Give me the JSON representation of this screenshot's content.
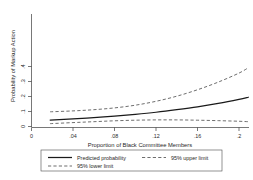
{
  "chart_data": {
    "type": "line",
    "title": "",
    "xlabel": "Proportion of Black Committee Members",
    "ylabel": "Probability of Markup Action",
    "xlim": [
      0,
      0.215
    ],
    "ylim": [
      0,
      0.45
    ],
    "xticks": [
      0,
      0.04,
      0.08,
      0.12,
      0.16,
      0.2
    ],
    "xticklabels": [
      "0",
      ".04",
      ".08",
      ".12",
      ".16",
      ".2"
    ],
    "yticks": [
      0,
      0.1,
      0.2,
      0.3,
      0.4
    ],
    "yticklabels": [
      "0",
      ".1",
      ".2",
      ".3",
      ".4"
    ],
    "grid": false,
    "legend_position": "below-axes",
    "x": [
      0.018,
      0.04,
      0.06,
      0.08,
      0.1,
      0.12,
      0.14,
      0.16,
      0.18,
      0.2,
      0.209
    ],
    "series": [
      {
        "name": "Predicted probability",
        "style": "solid",
        "values": [
          0.043,
          0.051,
          0.059,
          0.069,
          0.081,
          0.095,
          0.112,
          0.131,
          0.154,
          0.181,
          0.195
        ]
      },
      {
        "name": "95% upper limit",
        "style": "dashed",
        "values": [
          0.098,
          0.104,
          0.112,
          0.124,
          0.142,
          0.168,
          0.202,
          0.245,
          0.296,
          0.356,
          0.392
        ]
      },
      {
        "name": "95% lower limit",
        "style": "dashed",
        "values": [
          0.019,
          0.026,
          0.032,
          0.038,
          0.042,
          0.044,
          0.044,
          0.042,
          0.039,
          0.035,
          0.032
        ]
      }
    ],
    "legend": [
      {
        "label": "Predicted probability",
        "style": "solid"
      },
      {
        "label": "95% upper limit",
        "style": "dashed"
      },
      {
        "label": "95% lower limit",
        "style": "dashed"
      }
    ]
  }
}
